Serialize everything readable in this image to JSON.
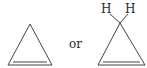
{
  "figure": {
    "type": "chemical-structure-comparison",
    "structures": [
      {
        "name": "cyclopropene",
        "representation": "skeletal",
        "ring_size": 3,
        "double_bond": "base"
      },
      {
        "name": "cyclopropene",
        "representation": "skeletal-with-hydrogens",
        "ring_size": 3,
        "double_bond": "base",
        "atom_labels": [
          "H",
          "H"
        ]
      }
    ],
    "connector_text": "or",
    "line_color": "#444444",
    "text_color": "#2a2a2a"
  }
}
